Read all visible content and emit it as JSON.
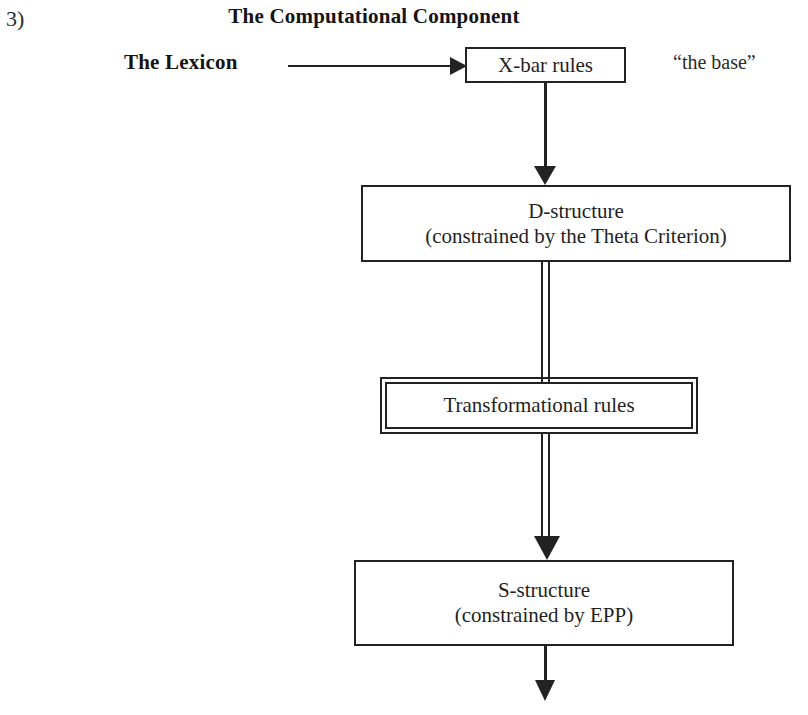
{
  "page": {
    "item_number": "3)",
    "title": "The Computational Component",
    "background_color": "#ffffff",
    "line_color": "#222222",
    "text_color": "#1f1f1f"
  },
  "labels": {
    "lexicon": "The Lexicon",
    "base": "“the base”"
  },
  "boxes": {
    "xbar": {
      "text": "X-bar rules",
      "border_style": "single"
    },
    "d_structure": {
      "line1": "D-structure",
      "line2": "(constrained by the Theta Criterion)",
      "border_style": "single"
    },
    "transformational": {
      "text": "Transformational rules",
      "border_style": "double"
    },
    "s_structure": {
      "line1": "S-structure",
      "line2": "(constrained by EPP)",
      "border_style": "single"
    }
  },
  "connectors": {
    "lexicon_to_xbar": {
      "style": "single-line-arrow",
      "direction": "right"
    },
    "xbar_to_d_structure": {
      "style": "single-line-arrow",
      "direction": "down"
    },
    "d_structure_to_transformational": {
      "style": "double-line",
      "direction": "down"
    },
    "transformational_to_s_structure": {
      "style": "double-line-arrow",
      "direction": "down"
    },
    "s_structure_to_next": {
      "style": "single-line-arrow",
      "direction": "down"
    }
  }
}
